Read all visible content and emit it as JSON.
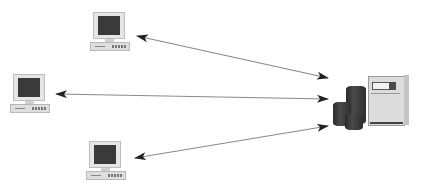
{
  "diagram": {
    "type": "client-server network",
    "nodes": [
      {
        "id": "client-top",
        "kind": "desktop-computer",
        "icon": "computer-icon"
      },
      {
        "id": "client-middle",
        "kind": "desktop-computer",
        "icon": "computer-icon"
      },
      {
        "id": "client-bottom",
        "kind": "desktop-computer",
        "icon": "computer-icon"
      },
      {
        "id": "server",
        "kind": "server-with-storage",
        "icon": "server-icon"
      }
    ],
    "links": [
      {
        "from": "client-top",
        "to": "server",
        "direction": "bidirectional"
      },
      {
        "from": "client-middle",
        "to": "server",
        "direction": "bidirectional"
      },
      {
        "from": "client-bottom",
        "to": "server",
        "direction": "bidirectional"
      }
    ],
    "colors": {
      "background": "#ffffff",
      "line": "#8a8a8a",
      "arrowhead": "#222222",
      "screen": "#3a3a3a",
      "body": "#e6e6e6"
    }
  }
}
